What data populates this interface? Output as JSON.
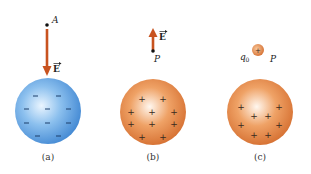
{
  "colors": {
    "background": "#ffffff",
    "arrow": "#c8531f",
    "negative_sphere_light": "#d6ecff",
    "negative_sphere_mid": "#7ab4ea",
    "negative_sphere_dark": "#4a8fd8",
    "positive_sphere_light": "#fff4ea",
    "positive_sphere_mid": "#ee9d5e",
    "positive_sphere_dark": "#d8742f",
    "dot": "#111111"
  },
  "panels": [
    {
      "id": "a",
      "caption": "(a)",
      "point_label": "A",
      "field_label": "E",
      "arrow_direction": "down",
      "sphere_charge": "negative",
      "charge_symbol": "−",
      "charge_count": 10
    },
    {
      "id": "b",
      "caption": "(b)",
      "point_label": "P",
      "field_label": "E",
      "arrow_direction": "up",
      "sphere_charge": "positive",
      "charge_symbol": "+",
      "charge_count": 10
    },
    {
      "id": "c",
      "caption": "(c)",
      "point_label": "P",
      "test_charge_label": "q0",
      "test_charge_symbol": "+",
      "sphere_charge": "positive",
      "charge_symbol": "+",
      "charge_count": 8
    }
  ]
}
